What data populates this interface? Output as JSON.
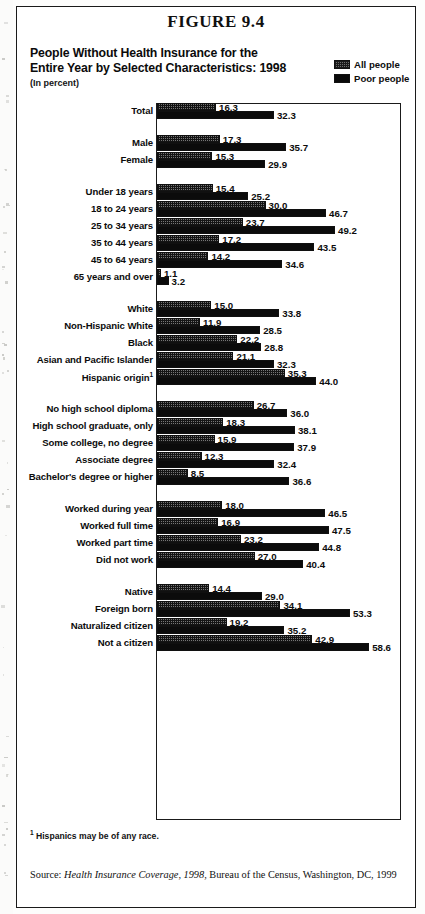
{
  "figure": {
    "number_label": "FIGURE 9.4",
    "title": "People Without Health Insurance for the\nEntire Year by Selected Characteristics:  1998",
    "title_line1": "People Without Health Insurance for the",
    "title_line2": "Entire Year by Selected Characteristics:  1998",
    "subtitle": "(In percent)",
    "footnote_marker": "1",
    "footnote_text": "Hispanics may be of any race.",
    "source_prefix": "Source: ",
    "source_italic": "Health Insurance Coverage, 1998",
    "source_rest": ", Bureau of the Census, Washington, DC, 1999"
  },
  "legend": {
    "position": "top-right",
    "items": [
      {
        "label": "All people",
        "swatch": "hatched-gray",
        "color": "#6e6e6e"
      },
      {
        "label": "Poor people",
        "swatch": "solid-black",
        "color": "#0a0a0a"
      }
    ]
  },
  "chart_data": {
    "type": "bar",
    "orientation": "horizontal",
    "title": "People Without Health Insurance for the Entire Year by Selected Characteristics: 1998",
    "subtitle": "(In percent)",
    "xlabel": "",
    "ylabel": "",
    "xlim": [
      0,
      67
    ],
    "grid": false,
    "legend_position": "top-right",
    "series": [
      {
        "name": "All people",
        "color": "#6e6e6e"
      },
      {
        "name": "Poor people",
        "color": "#0a0a0a"
      }
    ],
    "groups": [
      {
        "name": "total",
        "rows": [
          {
            "category": "Total",
            "all_people": 16.3,
            "poor_people": 32.3
          }
        ]
      },
      {
        "name": "sex",
        "rows": [
          {
            "category": "Male",
            "all_people": 17.3,
            "poor_people": 35.7
          },
          {
            "category": "Female",
            "all_people": 15.3,
            "poor_people": 29.9
          }
        ]
      },
      {
        "name": "age",
        "rows": [
          {
            "category": "Under 18 years",
            "all_people": 15.4,
            "poor_people": 25.2
          },
          {
            "category": "18 to 24 years",
            "all_people": 30.0,
            "poor_people": 46.7
          },
          {
            "category": "25 to 34 years",
            "all_people": 23.7,
            "poor_people": 49.2
          },
          {
            "category": "35 to 44 years",
            "all_people": 17.2,
            "poor_people": 43.5
          },
          {
            "category": "45 to 64 years",
            "all_people": 14.2,
            "poor_people": 34.6
          },
          {
            "category": "65 years and over",
            "all_people": 1.1,
            "poor_people": 3.2
          }
        ]
      },
      {
        "name": "race-and-hispanic-origin",
        "rows": [
          {
            "category": "White",
            "all_people": 15.0,
            "poor_people": 33.8
          },
          {
            "category": "Non-Hispanic White",
            "all_people": 11.9,
            "poor_people": 28.5
          },
          {
            "category": "Black",
            "all_people": 22.2,
            "poor_people": 28.8
          },
          {
            "category": "Asian and Pacific Islander",
            "all_people": 21.1,
            "poor_people": 32.3
          },
          {
            "category": "Hispanic origin",
            "footnote": "1",
            "all_people": 35.3,
            "poor_people": 44.0
          }
        ]
      },
      {
        "name": "education",
        "rows": [
          {
            "category": "No high school diploma",
            "all_people": 26.7,
            "poor_people": 36.0
          },
          {
            "category": "High school graduate, only",
            "all_people": 18.3,
            "poor_people": 38.1
          },
          {
            "category": "Some college, no degree",
            "all_people": 15.9,
            "poor_people": 37.9
          },
          {
            "category": "Associate degree",
            "all_people": 12.3,
            "poor_people": 32.4
          },
          {
            "category": "Bachelor's degree or higher",
            "all_people": 8.5,
            "poor_people": 36.6
          }
        ]
      },
      {
        "name": "work-experience",
        "rows": [
          {
            "category": "Worked during year",
            "all_people": 18.0,
            "poor_people": 46.5
          },
          {
            "category": "Worked full time",
            "all_people": 16.9,
            "poor_people": 47.5
          },
          {
            "category": "Worked part time",
            "all_people": 23.2,
            "poor_people": 44.8
          },
          {
            "category": "Did not work",
            "all_people": 27.0,
            "poor_people": 40.4
          }
        ]
      },
      {
        "name": "nativity",
        "rows": [
          {
            "category": "Native",
            "all_people": 14.4,
            "poor_people": 29.0
          },
          {
            "category": "Foreign born",
            "all_people": 34.1,
            "poor_people": 53.3
          },
          {
            "category": "Naturalized citizen",
            "all_people": 19.2,
            "poor_people": 35.2
          },
          {
            "category": "Not a citizen",
            "all_people": 42.9,
            "poor_people": 58.6
          }
        ]
      }
    ]
  }
}
